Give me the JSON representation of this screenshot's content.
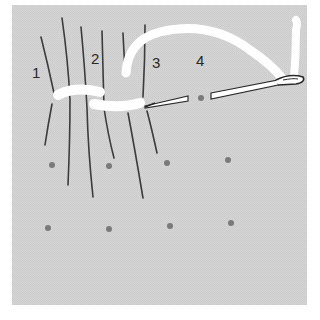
{
  "figure": {
    "background_color": "#d4d4d4",
    "labels": [
      {
        "text": "1",
        "x": 32,
        "y": 78
      },
      {
        "text": "2",
        "x": 92,
        "y": 64
      },
      {
        "text": "3",
        "x": 152,
        "y": 68
      },
      {
        "text": "4",
        "x": 196,
        "y": 66
      }
    ],
    "dot_color": "#7a7a7a",
    "dots": [
      {
        "x": 52,
        "y": 165
      },
      {
        "x": 109,
        "y": 166
      },
      {
        "x": 167,
        "y": 163
      },
      {
        "x": 228,
        "y": 160
      },
      {
        "x": 48,
        "y": 228
      },
      {
        "x": 109,
        "y": 229
      },
      {
        "x": 170,
        "y": 226
      },
      {
        "x": 231,
        "y": 223
      },
      {
        "x": 201,
        "y": 98
      }
    ],
    "thread_color": "#ffffff",
    "line_color": "#3c3c3c"
  }
}
